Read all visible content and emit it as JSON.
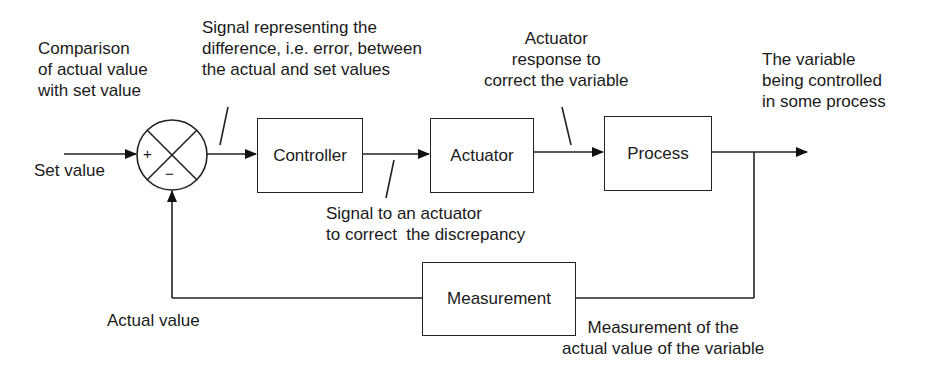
{
  "diagram": {
    "type": "closed-loop control system block diagram",
    "blocks": {
      "controller": "Controller",
      "actuator": "Actuator",
      "process": "Process",
      "measurement": "Measurement"
    },
    "comparator": {
      "plus": "+",
      "minus": "−"
    },
    "annotations": {
      "comparison": "Comparison\nof actual value\nwith set value",
      "error_signal": "Signal representing the\ndifference, i.e. error, between\nthe actual and set values",
      "actuator_signal": "Signal to an actuator\nto correct  the discrepancy",
      "actuator_response": "Actuator\nresponse to\ncorrect the variable",
      "controlled_variable": "The variable\nbeing controlled\nin some process",
      "set_value": "Set value",
      "actual_value": "Actual value",
      "measurement_note": "Measurement of the\nactual value of the variable"
    },
    "colors": {
      "line": "#222222",
      "background": "#ffffff",
      "text": "#1a1a1a"
    }
  }
}
